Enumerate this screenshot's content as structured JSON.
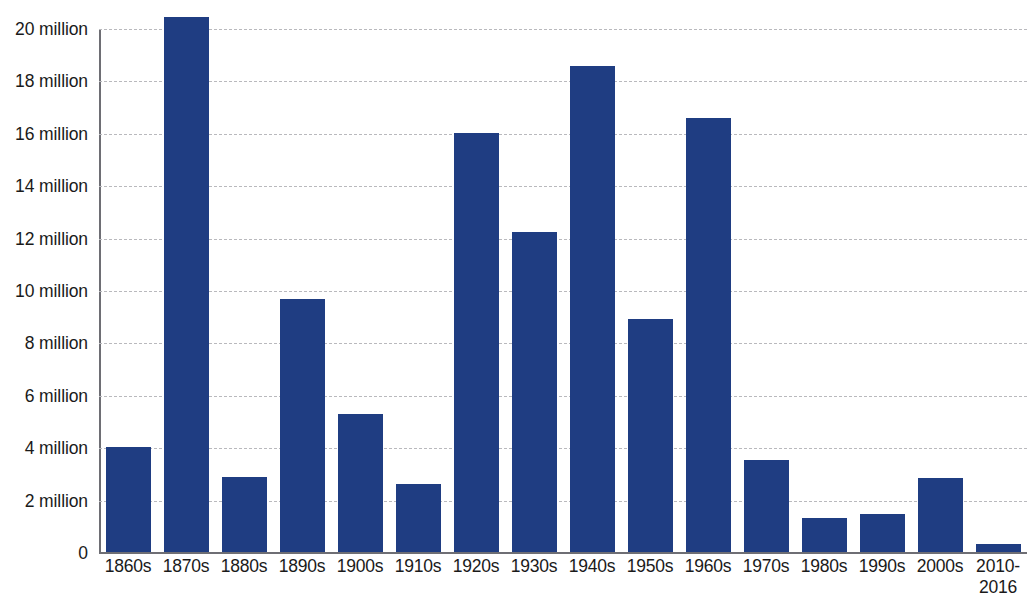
{
  "chart_data": {
    "type": "bar",
    "title": "",
    "subtitle": "",
    "xlabel": "",
    "ylabel": "",
    "ylim": [
      0,
      21
    ],
    "grid": true,
    "legend": null,
    "bar_color": "#1f3d82",
    "gridline_color": "#b9b9bd",
    "axis_color": "#6e6e74",
    "y_tick_values": [
      0,
      2,
      4,
      6,
      8,
      10,
      12,
      14,
      16,
      18,
      20
    ],
    "y_tick_labels": [
      "0",
      "2 million",
      "4 million",
      "6 million",
      "8 million",
      "10 million",
      "12 million",
      "14 million",
      "16 million",
      "18 million",
      "20 million"
    ],
    "categories": [
      "1860s",
      "1870s",
      "1880s",
      "1890s",
      "1900s",
      "1910s",
      "1920s",
      "1930s",
      "1940s",
      "1950s",
      "1960s",
      "1970s",
      "1980s",
      "1990s",
      "2000s",
      "2010-2016"
    ],
    "category_lines": [
      [
        "1860s"
      ],
      [
        "1870s"
      ],
      [
        "1880s"
      ],
      [
        "1890s"
      ],
      [
        "1900s"
      ],
      [
        "1910s"
      ],
      [
        "1920s"
      ],
      [
        "1930s"
      ],
      [
        "1940s"
      ],
      [
        "1950s"
      ],
      [
        "1960s"
      ],
      [
        "1970s"
      ],
      [
        "1980s"
      ],
      [
        "1990s"
      ],
      [
        "2000s"
      ],
      [
        "2010-",
        "2016"
      ]
    ],
    "values": [
      4.05,
      20.45,
      2.9,
      9.7,
      5.3,
      2.65,
      16.05,
      12.25,
      18.6,
      8.95,
      16.6,
      3.55,
      1.35,
      1.5,
      2.85,
      0.35
    ],
    "value_unit": "million"
  }
}
